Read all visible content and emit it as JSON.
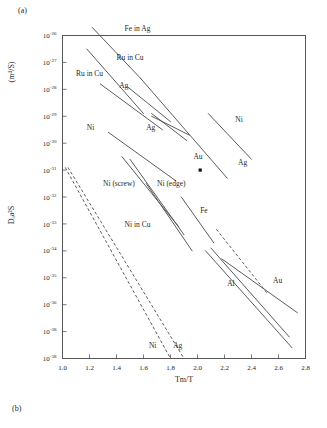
{
  "panels": {
    "top_tag": "(a)",
    "bottom_tag": "(b)"
  },
  "chart_data": {
    "type": "line",
    "title": "",
    "xlabel": "Tm/T",
    "ylabel": "Dₐa²S",
    "ylabel_units": "(m⁴/S)",
    "xlim": [
      1.0,
      2.8
    ],
    "ylim_exponents": [
      -38,
      -26
    ],
    "grid": false,
    "legend_position": "inline-annotations",
    "xticks": [
      "1.0",
      "1.2",
      "1.4",
      "1.6",
      "1.8",
      "2.0",
      "2.2",
      "2.4",
      "2.6",
      "2.8"
    ],
    "xtick_values": [
      1.0,
      1.2,
      1.4,
      1.6,
      1.8,
      2.0,
      2.2,
      2.4,
      2.6,
      2.8
    ],
    "yticks": [
      {
        "mantissa": "10",
        "exponent": "-26"
      },
      {
        "mantissa": "10",
        "exponent": "-27"
      },
      {
        "mantissa": "10",
        "exponent": "-28"
      },
      {
        "mantissa": "10",
        "exponent": "-29"
      },
      {
        "mantissa": "10",
        "exponent": "-30"
      },
      {
        "mantissa": "10",
        "exponent": "-31"
      },
      {
        "mantissa": "10",
        "exponent": "-32"
      },
      {
        "mantissa": "10",
        "exponent": "-33"
      },
      {
        "mantissa": "10",
        "exponent": "-34"
      },
      {
        "mantissa": "10",
        "exponent": "-35"
      },
      {
        "mantissa": "10",
        "exponent": "-36"
      },
      {
        "mantissa": "10",
        "exponent": "-38"
      },
      {
        "mantissa": "10",
        "exponent": "-38"
      }
    ],
    "series": [
      {
        "name": "Fe in Ag",
        "style": "solid",
        "x": [
          1.22,
          1.58
        ],
        "y_exp": [
          -25.7,
          -27.6
        ]
      },
      {
        "name": "Ru in Cu A",
        "style": "solid",
        "x": [
          1.18,
          1.6
        ],
        "y_exp": [
          -26.5,
          -28.9
        ]
      },
      {
        "name": "Ru in Cu B",
        "style": "solid",
        "x": [
          1.28,
          1.74
        ],
        "y_exp": [
          -27.8,
          -29.5
        ]
      },
      {
        "name": "Ag top",
        "style": "solid",
        "x": [
          1.48,
          1.8
        ],
        "y_exp": [
          -27.9,
          -29.2
        ]
      },
      {
        "name": "Ag mid-1",
        "style": "solid",
        "x": [
          1.66,
          1.92
        ],
        "y_exp": [
          -28.9,
          -29.9
        ]
      },
      {
        "name": "Ag mid-2",
        "style": "solid",
        "x": [
          1.66,
          1.94
        ],
        "y_exp": [
          -29.0,
          -29.7
        ]
      },
      {
        "name": "Ag long",
        "style": "solid",
        "x": [
          1.58,
          2.22
        ],
        "y_exp": [
          -27.6,
          -31.3
        ]
      },
      {
        "name": "Ni right",
        "style": "solid",
        "x": [
          2.08,
          2.4
        ],
        "y_exp": [
          -28.9,
          -30.6
        ]
      },
      {
        "name": "Ni left",
        "style": "solid",
        "x": [
          1.34,
          1.84
        ],
        "y_exp": [
          -29.6,
          -31.4
        ]
      },
      {
        "name": "Ni (screw)",
        "style": "solid",
        "x": [
          1.44,
          1.86
        ],
        "y_exp": [
          -30.5,
          -33.1
        ]
      },
      {
        "name": "Ni (edge)",
        "style": "solid",
        "x": [
          1.5,
          1.9
        ],
        "y_exp": [
          -30.6,
          -33.4
        ]
      },
      {
        "name": "Ni in Cu",
        "style": "solid",
        "x": [
          1.62,
          1.96
        ],
        "y_exp": [
          -31.5,
          -34.0
        ]
      },
      {
        "name": "Fe",
        "style": "solid",
        "x": [
          1.88,
          2.12
        ],
        "y_exp": [
          -32.0,
          -33.7
        ]
      },
      {
        "name": "Al",
        "style": "solid",
        "x": [
          2.06,
          2.7
        ],
        "y_exp": [
          -34.0,
          -37.6
        ]
      },
      {
        "name": "Au curve",
        "style": "solid",
        "x": [
          2.1,
          2.68
        ],
        "y_exp": [
          -33.9,
          -37.2
        ]
      },
      {
        "name": "Au right",
        "style": "solid",
        "x": [
          2.18,
          2.74
        ],
        "y_exp": [
          -34.3,
          -36.3
        ]
      },
      {
        "name": "Au dashed",
        "style": "dashed",
        "x": [
          2.14,
          2.52
        ],
        "y_exp": [
          -33.2,
          -35.6
        ]
      },
      {
        "name": "Ni dashed",
        "style": "dashed",
        "x": [
          1.02,
          1.8
        ],
        "y_exp": [
          -30.9,
          -38.0
        ]
      },
      {
        "name": "Ag dashed",
        "style": "dashed",
        "x": [
          1.04,
          1.9
        ],
        "y_exp": [
          -30.9,
          -38.0
        ]
      }
    ],
    "points": [
      {
        "name": "Au",
        "x": 2.02,
        "y_exp": -31.0
      }
    ],
    "annotations": [
      {
        "text": "Fe in Ag",
        "x": 1.46,
        "y_exp": -25.85
      },
      {
        "text": "Ru in Cu",
        "x": 1.4,
        "y_exp": -26.9
      },
      {
        "text": "Ru in Cu",
        "x": 1.1,
        "y_exp": -27.5
      },
      {
        "text": "Ag",
        "x": 1.42,
        "y_exp": -27.95
      },
      {
        "text": "Ag",
        "x": 1.62,
        "y_exp": -29.5
      },
      {
        "text": "Ni",
        "x": 1.18,
        "y_exp": -29.5
      },
      {
        "text": "Ni",
        "x": 2.28,
        "y_exp": -29.2
      },
      {
        "text": "Au",
        "x": 1.97,
        "y_exp": -30.6
      },
      {
        "text": "Ag",
        "x": 2.3,
        "y_exp": -30.8
      },
      {
        "text": "Ni (screw)",
        "x": 1.3,
        "y_exp": -31.6
      },
      {
        "text": "Ni (edge)",
        "x": 1.7,
        "y_exp": -31.6
      },
      {
        "text": "Fe",
        "x": 2.02,
        "y_exp": -32.6
      },
      {
        "text": "Ni in Cu",
        "x": 1.46,
        "y_exp": -33.1
      },
      {
        "text": "Al",
        "x": 2.22,
        "y_exp": -35.3
      },
      {
        "text": "Au",
        "x": 2.56,
        "y_exp": -35.2
      },
      {
        "text": "Ni",
        "x": 1.64,
        "y_exp": -37.6
      },
      {
        "text": "Ag",
        "x": 1.82,
        "y_exp": -37.6
      }
    ]
  }
}
